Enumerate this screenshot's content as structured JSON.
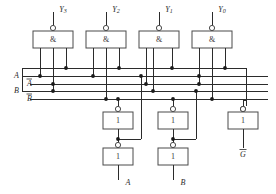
{
  "diagram": {
    "kind": "logic-circuit-schematic",
    "colors": {
      "background": "#ffffff",
      "wire": "#2b2b2b",
      "gate_outline": "#4a4a4a",
      "junction_dot": "#1a1a1a",
      "text": "#2b2b2b"
    }
  },
  "nand_gates": {
    "symbol": "&",
    "count": 4,
    "gates": [
      {
        "id": "nand-y3",
        "label": "&",
        "output_label": "Y",
        "output_subscript": "3",
        "x": 33,
        "y": 31,
        "w": 40,
        "h": 17
      },
      {
        "id": "nand-y2",
        "label": "&",
        "output_label": "Y",
        "output_subscript": "2",
        "x": 86,
        "y": 31,
        "w": 40,
        "h": 17
      },
      {
        "id": "nand-y1",
        "label": "&",
        "output_label": "Y",
        "output_subscript": "1",
        "x": 139,
        "y": 31,
        "w": 40,
        "h": 17
      },
      {
        "id": "nand-y0",
        "label": "&",
        "output_label": "Y",
        "output_subscript": "0",
        "x": 192,
        "y": 31,
        "w": 40,
        "h": 17
      }
    ]
  },
  "inverters": {
    "symbol": "1",
    "count": 5,
    "gates": [
      {
        "id": "inv-a-1",
        "label": "1",
        "x": 103,
        "y": 112,
        "w": 30,
        "h": 17,
        "output_label": ""
      },
      {
        "id": "inv-a-2",
        "label": "1",
        "x": 103,
        "y": 148,
        "w": 30,
        "h": 17,
        "output_label": "A"
      },
      {
        "id": "inv-b-1",
        "label": "1",
        "x": 158,
        "y": 112,
        "w": 30,
        "h": 17,
        "output_label": ""
      },
      {
        "id": "inv-b-2",
        "label": "1",
        "x": 158,
        "y": 148,
        "w": 30,
        "h": 17,
        "output_label": "B"
      },
      {
        "id": "inv-g",
        "label": "1",
        "x": 228,
        "y": 112,
        "w": 30,
        "h": 17,
        "output_label": "G",
        "output_overbar": true
      }
    ]
  },
  "bus_labels": {
    "enable": "",
    "a": "A",
    "a_not": "A",
    "a_not_overbar": true,
    "b": "B",
    "b_not": "B",
    "b_not_overbar": true
  },
  "output_labels": {
    "y3": "Y",
    "y3_sub": "3",
    "y2": "Y",
    "y2_sub": "2",
    "y1": "Y",
    "y1_sub": "1",
    "y0": "Y",
    "y0_sub": "0",
    "a": "A",
    "b": "B",
    "g_not": "G",
    "g_not_overbar": true
  }
}
